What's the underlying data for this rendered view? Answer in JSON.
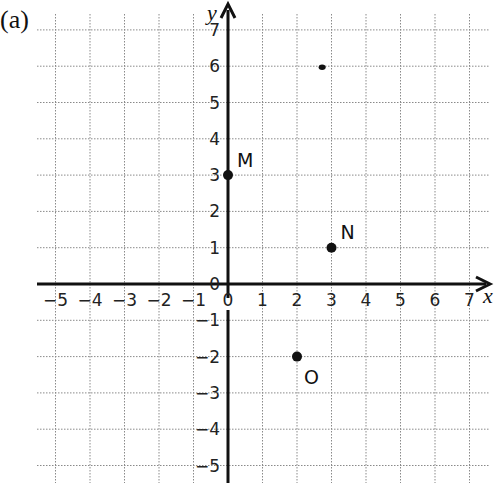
{
  "figure": {
    "panel_label": "(a)",
    "x_axis_label": "x",
    "y_axis_label": "y"
  },
  "chart_data": {
    "type": "scatter",
    "title": "",
    "xlabel": "x",
    "ylabel": "y",
    "xlim": [
      -5,
      7
    ],
    "ylim": [
      -5,
      7
    ],
    "grid": true,
    "x_ticks": [
      -5,
      -4,
      -3,
      -2,
      -1,
      0,
      1,
      2,
      3,
      4,
      5,
      6,
      7
    ],
    "y_ticks": [
      -5,
      -4,
      -3,
      -2,
      -1,
      0,
      1,
      2,
      3,
      4,
      5,
      6,
      7
    ],
    "x_tick_labels": [
      "−5",
      "−4",
      "−3",
      "−2",
      "−1",
      "0",
      "1",
      "2",
      "3",
      "4",
      "5",
      "6",
      "7"
    ],
    "y_tick_labels": [
      "−5",
      "−4",
      "−3",
      "−2",
      "−1",
      "0",
      "1",
      "2",
      "3",
      "4",
      "5",
      "6",
      "7"
    ],
    "points": [
      {
        "label": "M",
        "x": 0,
        "y": 3
      },
      {
        "label": "N",
        "x": 3,
        "y": 1
      },
      {
        "label": "O",
        "x": 2,
        "y": -2
      }
    ],
    "annotations": [
      {
        "type": "smudge",
        "x": 2.7,
        "y": 6
      }
    ]
  },
  "style": {
    "axis_color": "#111111",
    "grid_color": "#8a8a8a",
    "point_color": "#111111",
    "background": "#ffffff"
  }
}
